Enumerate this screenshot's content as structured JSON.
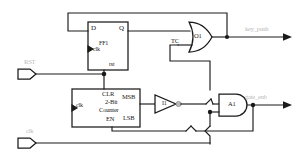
{
  "diagram": {
    "line_color": "#1a1a1a",
    "faint_label_color": "#b9b9b9",
    "background": "#ffffff"
  },
  "ports": {
    "inputs": [
      {
        "name": "rst-port",
        "label": "RST"
      },
      {
        "name": "clk-port",
        "label": "clk"
      }
    ],
    "outputs": [
      {
        "name": "key-push-output",
        "label": "key_push"
      },
      {
        "name": "gate-enable-output",
        "label": "gate_enb"
      }
    ]
  },
  "blocks": {
    "flipflop": {
      "name": "FF1",
      "d_label": "D",
      "q_label": "Q",
      "clk_label": "clk",
      "rst_label": "rst"
    },
    "counter": {
      "title_line1": "2-Bit",
      "title_line2": "Counter",
      "clr_label": "CLR",
      "en_label": "EN",
      "msb_label": "MSB",
      "lsb_label": "LSB",
      "clk_label": "clk"
    }
  },
  "gates": {
    "or_gate": {
      "label": "O1",
      "type": "OR"
    },
    "and_gate": {
      "label": "A1",
      "type": "AND"
    },
    "inverter": {
      "label": "I1",
      "type": "INV"
    }
  },
  "signals": {
    "tc_label": "TC"
  }
}
